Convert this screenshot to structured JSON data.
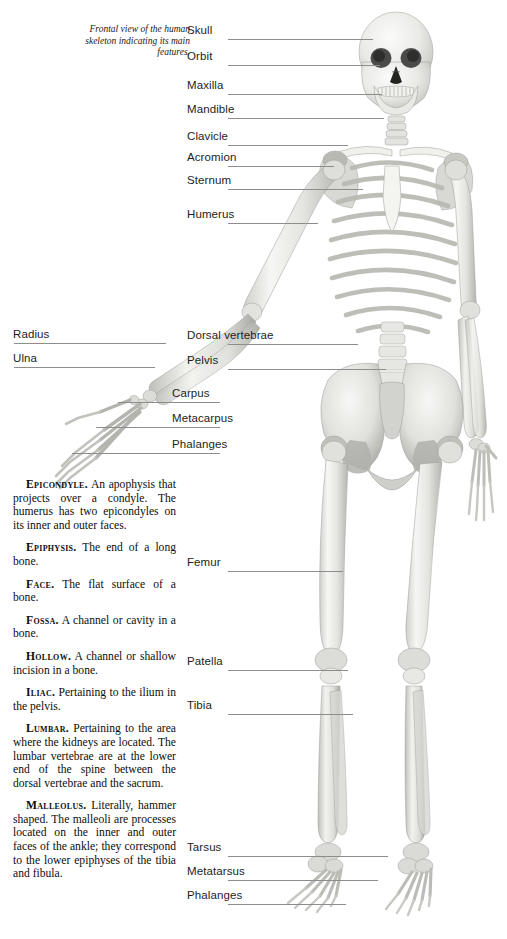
{
  "page": {
    "background": "#ffffff",
    "width": 507,
    "height": 939
  },
  "caption": {
    "text": "Frontal view of the human skeleton indicating its main features."
  },
  "figure": {
    "name": "human-skeleton-frontal-view",
    "bone_tone_light": "#f2f2f0",
    "bone_tone_mid": "#d8d8d4",
    "bone_tone_shadow": "#a9a9a4"
  },
  "leader_line_color": "#8d8d8d",
  "labels": [
    {
      "id": "skull",
      "text": "Skull",
      "side": "right",
      "x": 187,
      "y": 24,
      "line_x": 228,
      "line_y": 39,
      "line_w": 145
    },
    {
      "id": "orbit",
      "text": "Orbit",
      "side": "right",
      "x": 187,
      "y": 50,
      "line_x": 228,
      "line_y": 65,
      "line_w": 152
    },
    {
      "id": "maxilla",
      "text": "Maxilla",
      "side": "right",
      "x": 187,
      "y": 79,
      "line_x": 228,
      "line_y": 94,
      "line_w": 154
    },
    {
      "id": "mandible",
      "text": "Mandible",
      "side": "right",
      "x": 187,
      "y": 103,
      "line_x": 228,
      "line_y": 118,
      "line_w": 156
    },
    {
      "id": "clavicle",
      "text": "Clavicle",
      "side": "right",
      "x": 187,
      "y": 130,
      "line_x": 228,
      "line_y": 145,
      "line_w": 120
    },
    {
      "id": "acromion",
      "text": "Acromion",
      "side": "right",
      "x": 187,
      "y": 151,
      "line_x": 228,
      "line_y": 166,
      "line_w": 106
    },
    {
      "id": "sternum",
      "text": "Sternum",
      "side": "right",
      "x": 187,
      "y": 174,
      "line_x": 228,
      "line_y": 189,
      "line_w": 135
    },
    {
      "id": "humerus",
      "text": "Humerus",
      "side": "right",
      "x": 187,
      "y": 208,
      "line_x": 228,
      "line_y": 223,
      "line_w": 90
    },
    {
      "id": "radius",
      "text": "Radius",
      "side": "left",
      "x": 13,
      "y": 328,
      "line_x": 14,
      "line_y": 343,
      "line_w": 152
    },
    {
      "id": "ulna",
      "text": "Ulna",
      "side": "left",
      "x": 13,
      "y": 352,
      "line_x": 14,
      "line_y": 367,
      "line_w": 141
    },
    {
      "id": "dorsal-vertebrae",
      "text": "Dorsal vertebrae",
      "side": "right",
      "x": 187,
      "y": 329,
      "line_x": 228,
      "line_y": 344,
      "line_w": 130
    },
    {
      "id": "pelvis",
      "text": "Pelvis",
      "side": "right",
      "x": 187,
      "y": 354,
      "line_x": 228,
      "line_y": 369,
      "line_w": 158
    },
    {
      "id": "carpus",
      "text": "Carpus",
      "side": "right",
      "x": 172,
      "y": 387,
      "line_x": 118,
      "line_y": 402,
      "line_w": 102
    },
    {
      "id": "metacarpus",
      "text": "Metacarpus",
      "side": "right",
      "x": 172,
      "y": 412,
      "line_x": 96,
      "line_y": 427,
      "line_w": 124
    },
    {
      "id": "phalanges-hand",
      "text": "Phalanges",
      "side": "right",
      "x": 172,
      "y": 438,
      "line_x": 72,
      "line_y": 453,
      "line_w": 148
    },
    {
      "id": "femur",
      "text": "Femur",
      "side": "right",
      "x": 187,
      "y": 556,
      "line_x": 228,
      "line_y": 571,
      "line_w": 115
    },
    {
      "id": "patella",
      "text": "Patella",
      "side": "right",
      "x": 187,
      "y": 655,
      "line_x": 228,
      "line_y": 670,
      "line_w": 120
    },
    {
      "id": "tibia",
      "text": "Tibia",
      "side": "right",
      "x": 187,
      "y": 699,
      "line_x": 228,
      "line_y": 714,
      "line_w": 125
    },
    {
      "id": "tarsus",
      "text": "Tarsus",
      "side": "right",
      "x": 187,
      "y": 841,
      "line_x": 228,
      "line_y": 856,
      "line_w": 160
    },
    {
      "id": "metatarsus",
      "text": "Metatarsus",
      "side": "right",
      "x": 187,
      "y": 865,
      "line_x": 228,
      "line_y": 880,
      "line_w": 150
    },
    {
      "id": "phalanges-foot",
      "text": "Phalanges",
      "side": "right",
      "x": 187,
      "y": 889,
      "line_x": 228,
      "line_y": 904,
      "line_w": 118
    }
  ],
  "glossary": {
    "entries": [
      {
        "term": "Epicondyle.",
        "definition": " An apophysis that projects over a condyle. The humerus has two epicondyles on its inner and outer faces."
      },
      {
        "term": "Epiphysis.",
        "definition": " The end of a long bone."
      },
      {
        "term": "Face.",
        "definition": " The flat surface of a bone."
      },
      {
        "term": "Fossa.",
        "definition": " A channel or cavity in a bone."
      },
      {
        "term": "Hollow.",
        "definition": " A channel or shallow incision in a bone."
      },
      {
        "term": "Iliac.",
        "definition": " Pertaining to the ilium in the pelvis."
      },
      {
        "term": "Lumbar.",
        "definition": " Pertaining to the area where the kidneys are located. The lumbar vertebrae are at the lower end of the spine between the dorsal vertebrae and the sacrum."
      },
      {
        "term": "Malleolus.",
        "definition": " Literally, hammer shaped. The malleoli are processes located on the inner and outer faces of the ankle; they correspond to the lower epiphyses of the tibia and fibula."
      }
    ]
  }
}
